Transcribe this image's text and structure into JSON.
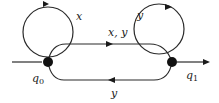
{
  "diagram": {
    "type": "finite-automaton",
    "states": [
      {
        "id": "q0",
        "label": "q0",
        "sub": "0",
        "initial": true,
        "final": false
      },
      {
        "id": "q1",
        "label": "q1",
        "sub": "1",
        "initial": false,
        "final": true
      }
    ],
    "transitions": [
      {
        "from": "q0",
        "to": "q0",
        "label": "x"
      },
      {
        "from": "q0",
        "to": "q1",
        "label": "x, y"
      },
      {
        "from": "q1",
        "to": "q1",
        "label": "y"
      },
      {
        "from": "q1",
        "to": "q0",
        "label": "y"
      }
    ],
    "labels": {
      "q0_base": "q",
      "q0_sub": "0",
      "q1_base": "q",
      "q1_sub": "1",
      "loop_q0": "x",
      "edge_q0_q1": "x, y",
      "loop_q1": "y",
      "edge_q1_q0": "y"
    },
    "colors": {
      "stroke": "#2a2a2a",
      "node": "#111111",
      "background": "#ffffff"
    }
  }
}
